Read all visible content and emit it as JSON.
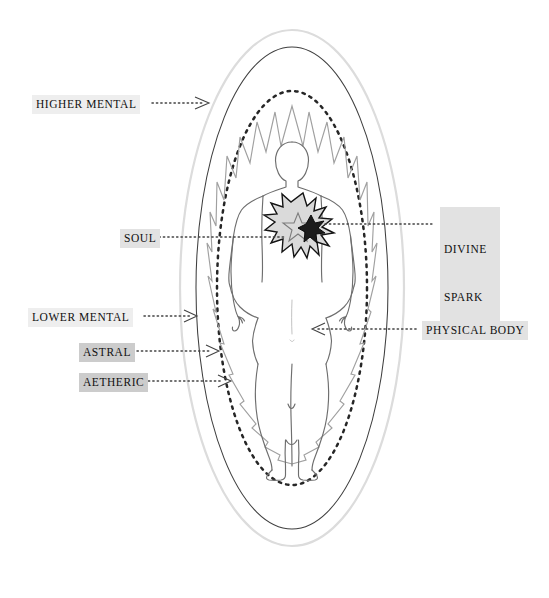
{
  "diagram": {
    "figure_description": "Human silhouette surrounded by concentric aura ovals with a starburst at the heart",
    "colors": {
      "outer_oval": "#d9d9d9",
      "mid_oval": "#3a3a3a",
      "dotted_oval": "#2b2b2b",
      "aura_zigzag": "#9b9b9b",
      "body_outline": "#6f6f6f",
      "starburst_outline": "#1a1a1a",
      "starburst_fill": "#d8d8d8",
      "leader_line": "#4a4a4a",
      "label_text": "#101010",
      "highlight_light": "#eeeeee",
      "highlight_medium": "#e2e2e2",
      "highlight_dark": "#cccccc"
    },
    "labels": {
      "higher_mental": "HIGHER MENTAL",
      "lower_mental": "LOWER MENTAL",
      "astral": "ASTRAL",
      "aetheric": "AETHERIC",
      "soul": "SOUL",
      "divine_spark_line1": "DIVINE",
      "divine_spark_line2": "SPARK",
      "physical_body": "PHYSICAL BODY"
    },
    "layers": [
      {
        "name": "HIGHER MENTAL",
        "side": "left",
        "target": "outermost-gray-oval"
      },
      {
        "name": "LOWER MENTAL",
        "side": "left",
        "target": "solid-dark-oval"
      },
      {
        "name": "ASTRAL",
        "side": "left",
        "target": "dotted-oval"
      },
      {
        "name": "AETHERIC",
        "side": "left",
        "target": "zigzag-aura"
      },
      {
        "name": "SOUL",
        "side": "left",
        "target": "heart-starburst"
      },
      {
        "name": "DIVINE SPARK",
        "side": "right",
        "target": "inner-dark-star"
      },
      {
        "name": "PHYSICAL BODY",
        "side": "right",
        "target": "human-silhouette"
      }
    ]
  }
}
